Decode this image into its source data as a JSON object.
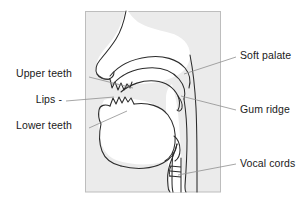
{
  "figure": {
    "frame": {
      "x": 85,
      "y": 11,
      "width": 136,
      "height": 181,
      "fill": "#ebebeb",
      "stroke": "#b9b9b9"
    },
    "colors": {
      "outline": "#2b2b2b",
      "leader_line": "#8a8a8a",
      "label_text": "#1a1a1a",
      "background": "#ffffff",
      "tract_fill": "#ffffff",
      "shade": "#ebebeb"
    }
  },
  "labels": {
    "left": [
      {
        "id": "upper-teeth",
        "text": "Upper teeth"
      },
      {
        "id": "lips",
        "text": "Lips -"
      },
      {
        "id": "lower-teeth",
        "text": "Lower teeth"
      }
    ],
    "right": [
      {
        "id": "soft-palate",
        "text": "Soft palate"
      },
      {
        "id": "gum-ridge",
        "text": "Gum ridge"
      },
      {
        "id": "vocal-cords",
        "text": "Vocal cords"
      }
    ]
  },
  "leader_lines": [
    {
      "name": "upper-teeth-leader",
      "x1": 89,
      "y1": 77,
      "x2": 133,
      "y2": 88
    },
    {
      "name": "lips-leader",
      "x1": 66,
      "y1": 101,
      "x2": 114,
      "y2": 97
    },
    {
      "name": "lower-teeth-leader",
      "x1": 89,
      "y1": 128,
      "x2": 127,
      "y2": 111
    },
    {
      "name": "soft-palate-leader",
      "x1": 236,
      "y1": 57,
      "x2": 184,
      "y2": 74
    },
    {
      "name": "gum-ridge-leader",
      "x1": 236,
      "y1": 110,
      "x2": 181,
      "y2": 96
    },
    {
      "name": "vocal-cords-leader",
      "x1": 236,
      "y1": 164,
      "x2": 178,
      "y2": 175
    }
  ],
  "anatomy_parts": [
    "nose-profile",
    "nasal-cavity",
    "hard-palate",
    "soft-palate",
    "upper-teeth",
    "lower-teeth",
    "lips",
    "tongue",
    "lower-jaw",
    "pharynx",
    "epiglottis",
    "larynx",
    "vocal-cords",
    "trachea"
  ]
}
